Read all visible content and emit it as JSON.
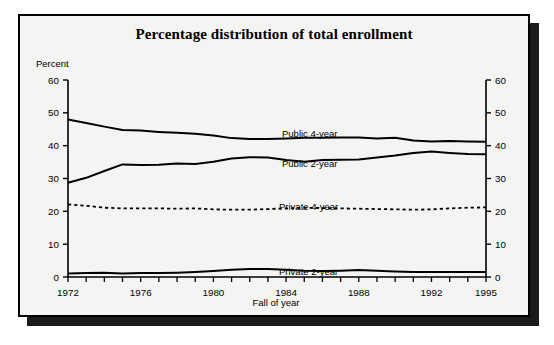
{
  "figure": {
    "title": "Percentage distribution of total enrollment",
    "y_axis_caption": "Percent",
    "x_axis_caption": "Fall of year"
  },
  "chart_data": {
    "type": "line",
    "title": "Percentage distribution of total enrollment",
    "xlabel": "Fall of year",
    "ylabel": "Percent",
    "xlim": [
      1972,
      1995
    ],
    "ylim": [
      0,
      60
    ],
    "grid": false,
    "legend": "inline-labels",
    "dual_y_axis": true,
    "y_ticks": [
      0,
      10,
      20,
      30,
      40,
      50,
      60
    ],
    "y_ticks_right": [
      0,
      10,
      20,
      30,
      40,
      50,
      60
    ],
    "x_ticks_labeled": [
      1972,
      1976,
      1980,
      1984,
      1988,
      1992,
      1995
    ],
    "x_ticks_all": [
      1972,
      1973,
      1974,
      1975,
      1976,
      1977,
      1978,
      1979,
      1980,
      1981,
      1982,
      1983,
      1984,
      1985,
      1986,
      1987,
      1988,
      1989,
      1990,
      1991,
      1992,
      1993,
      1994,
      1995
    ],
    "x": [
      1972,
      1973,
      1974,
      1975,
      1976,
      1977,
      1978,
      1979,
      1980,
      1981,
      1982,
      1983,
      1984,
      1985,
      1986,
      1987,
      1988,
      1989,
      1990,
      1991,
      1992,
      1993,
      1994,
      1995
    ],
    "series": [
      {
        "name": "Public 4-year",
        "style": "solid",
        "color": "#000000",
        "values": [
          48.0,
          46.9,
          45.8,
          44.8,
          44.6,
          44.2,
          43.9,
          43.6,
          43.1,
          42.3,
          42.0,
          42.0,
          42.2,
          42.4,
          42.4,
          42.5,
          42.5,
          42.2,
          42.4,
          41.6,
          41.3,
          41.4,
          41.3,
          41.2
        ]
      },
      {
        "name": "Public 2-year",
        "style": "solid",
        "color": "#000000",
        "values": [
          28.7,
          30.2,
          32.3,
          34.3,
          34.1,
          34.2,
          34.6,
          34.4,
          35.1,
          36.1,
          36.5,
          36.4,
          35.6,
          35.1,
          35.6,
          35.7,
          35.8,
          36.4,
          37.0,
          37.8,
          38.2,
          37.8,
          37.5,
          37.4
        ]
      },
      {
        "name": "Private 4-year",
        "style": "dotted",
        "color": "#000000",
        "values": [
          22.1,
          21.7,
          21.1,
          20.9,
          20.9,
          20.9,
          20.8,
          20.9,
          20.6,
          20.5,
          20.5,
          20.7,
          20.9,
          21.1,
          21.0,
          20.9,
          20.8,
          20.7,
          20.6,
          20.5,
          20.6,
          20.9,
          21.1,
          21.2
        ]
      },
      {
        "name": "Private 2-year",
        "style": "solid",
        "color": "#000000",
        "values": [
          1.1,
          1.2,
          1.3,
          1.1,
          1.2,
          1.2,
          1.3,
          1.5,
          1.8,
          2.2,
          2.4,
          2.4,
          2.2,
          1.9,
          1.8,
          1.9,
          2.1,
          1.9,
          1.7,
          1.5,
          1.5,
          1.5,
          1.5,
          1.5
        ]
      }
    ],
    "series_label_positions": [
      {
        "name": "Public 4-year",
        "x": 262,
        "y": 112
      },
      {
        "name": "Public 2-year",
        "x": 262,
        "y": 142
      },
      {
        "name": "Private 4-year",
        "x": 259,
        "y": 185
      },
      {
        "name": "Private 2-year",
        "x": 259,
        "y": 250
      }
    ]
  }
}
